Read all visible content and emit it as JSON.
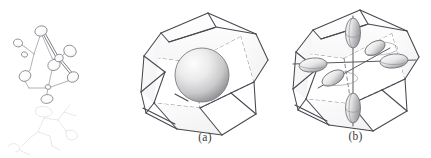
{
  "figure": {
    "background_color": "#ffffff",
    "width": 431,
    "height": 158
  },
  "panels": [
    {
      "id": "molecule",
      "caption": "",
      "description": "Faint ORTEP-style molecular skeleton with thermal ellipsoid atoms joined by bonds",
      "line_color": "#8d8d93",
      "atom_count": 9,
      "ghost_line_color": "#d8d8dc"
    },
    {
      "id": "a",
      "caption": "(a)",
      "description": "Polyhedral cage enclosing a single shaded sphere",
      "edge_color": "#4a4a4a",
      "hidden_edge_color": "#6f6f77",
      "sphere_color_light": "#f2f2f2",
      "sphere_color_dark": "#8e8e92",
      "face_tint": "#fbfbfb"
    },
    {
      "id": "b",
      "caption": "(b)",
      "description": "Same polyhedral cage containing six displacement ellipsoids on three orthogonal axes",
      "edge_color": "#4a4a4a",
      "hidden_edge_color": "#6f6f77",
      "ellipsoid_color_light": "#f4f4f4",
      "ellipsoid_color_dark": "#9a9a9e",
      "axis_color": "#5a5a5a",
      "ellipsoid_count": 6,
      "face_tint": "#fbfbfb"
    }
  ],
  "captions": {
    "a": "(a)",
    "b": "(b)"
  }
}
